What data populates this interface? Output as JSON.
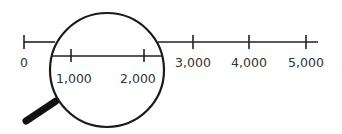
{
  "diagram": {
    "colors": {
      "line": "#222222",
      "text": "#333333",
      "handle": "#111111",
      "background": "#ffffff"
    },
    "outer_axis": {
      "labels": [
        "0",
        "3,000",
        "4,000",
        "5,000"
      ]
    },
    "magnified_axis": {
      "labels": [
        "1,000",
        "2,000"
      ]
    },
    "icon": "magnifying-glass-icon"
  }
}
